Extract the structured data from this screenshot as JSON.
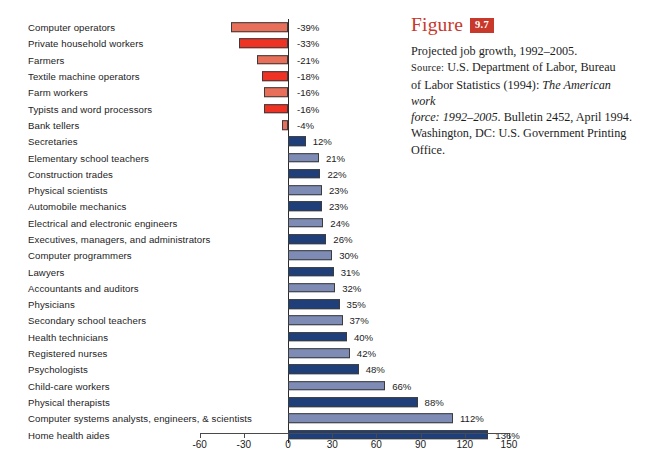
{
  "chart_data": {
    "type": "bar",
    "orientation": "horizontal",
    "title": "Projected job growth, 1992–2005.",
    "xlabel": "",
    "ylabel": "",
    "xlim": [
      -60,
      150
    ],
    "xticks": [
      -60,
      -30,
      0,
      30,
      60,
      90,
      120,
      150
    ],
    "xtick_labels": [
      "-60",
      "-30",
      "0",
      "30",
      "60",
      "90",
      "120",
      "150"
    ],
    "grid": false,
    "legend": "none",
    "value_suffix": "%",
    "categories": [
      "Computer operators",
      "Private household workers",
      "Farmers",
      "Textile machine operators",
      "Farm workers",
      "Typists and word processors",
      "Bank tellers",
      "Secretaries",
      "Elementary school teachers",
      "Construction trades",
      "Physical scientists",
      "Automobile mechanics",
      "Electrical and electronic engineers",
      "Executives, managers, and administrators",
      "Computer programmers",
      "Lawyers",
      "Accountants and auditors",
      "Physicians",
      "Secondary school teachers",
      "Health technicians",
      "Registered nurses",
      "Psychologists",
      "Child-care workers",
      "Physical therapists",
      "Computer systems analysts, engineers, & scientists",
      "Home health aides"
    ],
    "values": [
      -39,
      -33,
      -21,
      -18,
      -16,
      -16,
      -4,
      12,
      21,
      22,
      23,
      23,
      24,
      26,
      30,
      31,
      32,
      35,
      37,
      40,
      42,
      48,
      66,
      88,
      112,
      136
    ],
    "value_labels": [
      "-39%",
      "-33%",
      "-21%",
      "-18%",
      "-16%",
      "-16%",
      "-4%",
      "12%",
      "21%",
      "22%",
      "23%",
      "23%",
      "24%",
      "26%",
      "30%",
      "31%",
      "32%",
      "35%",
      "37%",
      "40%",
      "42%",
      "48%",
      "66%",
      "88%",
      "112%",
      "136%"
    ],
    "bar_colors": [
      "#e8705a",
      "#ee3224",
      "#e8705a",
      "#ee3224",
      "#e8705a",
      "#ee3224",
      "#e8705a",
      "#1f3f7a",
      "#7e8cb5",
      "#1f3f7a",
      "#7e8cb5",
      "#1f3f7a",
      "#7e8cb5",
      "#1f3f7a",
      "#7e8cb5",
      "#1f3f7a",
      "#7e8cb5",
      "#1f3f7a",
      "#7e8cb5",
      "#1f3f7a",
      "#7e8cb5",
      "#1f3f7a",
      "#7e8cb5",
      "#1f3f7a",
      "#7e8cb5",
      "#1f3f7a"
    ],
    "palette": {
      "negative_light": "#e8705a",
      "negative_dark": "#ee3224",
      "positive_dark": "#1f3f7a",
      "positive_light": "#7e8cb5",
      "bar_outline": "#3b3b3b",
      "axis": "#4a4a4a"
    }
  },
  "caption": {
    "figure_word": "Figure",
    "figure_number": "9.7",
    "accent_color": "#c8382b",
    "line1": "Projected job growth, 1992–2005.",
    "source_label": "Source:",
    "source_rest": " U.S. Department of Labor, Bureau",
    "line3_a": "of Labor Statistics (1994): ",
    "line3_italic": "The American work",
    "line4_italic": "force: 1992–2005",
    "line4_rest": ". Bulletin 2452, April 1994.",
    "line5": "Washington, DC: U.S. Government Printing",
    "line6": "Office."
  }
}
